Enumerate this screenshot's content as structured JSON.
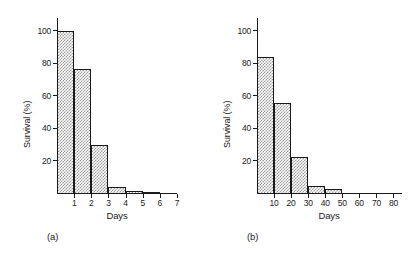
{
  "figure": {
    "panels": [
      {
        "tag": "(a)",
        "xlabel": "Days",
        "ylabel": "Survival (%)",
        "yticks": [
          "100",
          "80",
          "60",
          "40",
          "20"
        ],
        "xticks": [
          "1",
          "2",
          "3",
          "4",
          "5",
          "6",
          "7"
        ]
      },
      {
        "tag": "(b)",
        "xlabel": "Days",
        "ylabel": "Survival (%)",
        "yticks": [
          "100",
          "80",
          "60",
          "40",
          "20"
        ],
        "xticks": [
          "10",
          "20",
          "30",
          "40",
          "50",
          "60",
          "70",
          "80"
        ]
      }
    ]
  },
  "chart_data": [
    {
      "type": "bar",
      "title": "(a)",
      "xlabel": "Days",
      "ylabel": "Survival (%)",
      "categories": [
        "0-1",
        "1-2",
        "2-3",
        "3-4",
        "4-5",
        "5-6"
      ],
      "bin_edges": [
        0,
        1,
        2,
        3,
        4,
        5,
        6
      ],
      "values": [
        100,
        77,
        30,
        4,
        2,
        0.8
      ],
      "xlim": [
        0,
        7
      ],
      "ylim": [
        0,
        108
      ],
      "xtick_values": [
        1,
        2,
        3,
        4,
        5,
        6,
        7
      ],
      "xtick_labels": [
        "1",
        "2",
        "3",
        "4",
        "5",
        "6",
        "7"
      ],
      "ytick_values": [
        20,
        40,
        60,
        80,
        100
      ],
      "ytick_labels": [
        "20",
        "40",
        "60",
        "80",
        "100"
      ],
      "grid": false,
      "legend": false,
      "bar_fill": "checkerboard-stipple-gray",
      "bar_edge_color": "#1a1a1a"
    },
    {
      "type": "bar",
      "title": "(b)",
      "xlabel": "Days",
      "ylabel": "Survival (%)",
      "categories": [
        "0-10",
        "10-20",
        "20-30",
        "30-40",
        "40-50"
      ],
      "bin_edges": [
        0,
        10,
        20,
        30,
        40,
        50
      ],
      "values": [
        84,
        56,
        23,
        5,
        3
      ],
      "xlim": [
        0,
        85
      ],
      "ylim": [
        0,
        108
      ],
      "xtick_values": [
        10,
        20,
        30,
        40,
        50,
        60,
        70,
        80
      ],
      "xtick_labels": [
        "10",
        "20",
        "30",
        "40",
        "50",
        "60",
        "70",
        "80"
      ],
      "ytick_values": [
        20,
        40,
        60,
        80,
        100
      ],
      "ytick_labels": [
        "20",
        "40",
        "60",
        "80",
        "100"
      ],
      "grid": false,
      "legend": false,
      "bar_fill": "checkerboard-stipple-gray",
      "bar_edge_color": "#1a1a1a"
    }
  ],
  "colors": {
    "ink": "#1a1a1a",
    "bar_stipple": "#9a9a9a",
    "background": "#ffffff"
  }
}
